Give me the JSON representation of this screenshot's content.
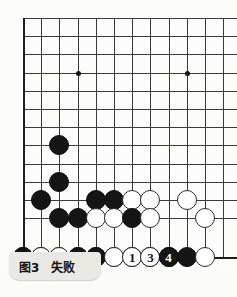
{
  "figure": {
    "caption_label": "图3",
    "caption_text": "失败",
    "caption_full": "图3　失败"
  },
  "board": {
    "type": "go-board-corner-diagram",
    "columns": 12,
    "rows": 13,
    "cell_size": 18.2,
    "origin_x": 23,
    "origin_y": 18,
    "line_color": "#3a3a3a",
    "edge_color": "#1d1d1d",
    "background": "#fcfcfa",
    "star_points": [
      {
        "col": 4,
        "row": 4
      },
      {
        "col": 10,
        "row": 4
      }
    ]
  },
  "stones": [
    {
      "col": 3,
      "row": 8,
      "color": "black",
      "label": ""
    },
    {
      "col": 3,
      "row": 10,
      "color": "black",
      "label": ""
    },
    {
      "col": 2,
      "row": 11,
      "color": "black",
      "label": ""
    },
    {
      "col": 5,
      "row": 11,
      "color": "black",
      "label": ""
    },
    {
      "col": 6,
      "row": 11,
      "color": "black",
      "label": ""
    },
    {
      "col": 7,
      "row": 11,
      "color": "white",
      "label": ""
    },
    {
      "col": 8,
      "row": 11,
      "color": "white",
      "label": ""
    },
    {
      "col": 10,
      "row": 11,
      "color": "white",
      "label": ""
    },
    {
      "col": 3,
      "row": 12,
      "color": "black",
      "label": ""
    },
    {
      "col": 4,
      "row": 12,
      "color": "black",
      "label": ""
    },
    {
      "col": 5,
      "row": 12,
      "color": "white",
      "label": ""
    },
    {
      "col": 6,
      "row": 12,
      "color": "white",
      "label": ""
    },
    {
      "col": 7,
      "row": 12,
      "color": "black",
      "label": ""
    },
    {
      "col": 8,
      "row": 12,
      "color": "white",
      "label": ""
    },
    {
      "col": 11,
      "row": 12,
      "color": "white",
      "label": ""
    },
    {
      "col": 1,
      "row": 13,
      "color": "black",
      "label": ""
    },
    {
      "col": 2,
      "row": 13,
      "color": "black",
      "label": ""
    },
    {
      "col": 3,
      "row": 13,
      "color": "white",
      "label": ""
    },
    {
      "col": 4,
      "row": 13,
      "color": "white",
      "label": ""
    },
    {
      "col": 5,
      "row": 13,
      "color": "white",
      "label": "5"
    },
    {
      "col": 6,
      "row": 13,
      "color": "white",
      "label": ""
    },
    {
      "col": 7,
      "row": 13,
      "color": "black",
      "label": ""
    },
    {
      "col": 8,
      "row": 13,
      "color": "black",
      "label": ""
    },
    {
      "col": 9,
      "row": 13,
      "color": "black",
      "label": ""
    },
    {
      "col": 10,
      "row": 13,
      "color": "black",
      "label": ""
    },
    {
      "col": 11,
      "row": 13,
      "color": "white",
      "label": ""
    },
    {
      "col": 1,
      "row": 14,
      "color": "black",
      "label": "8"
    },
    {
      "col": 2,
      "row": 14,
      "color": "white",
      "label": ""
    },
    {
      "col": 3,
      "row": 14,
      "color": "white",
      "label": "7"
    },
    {
      "col": 4,
      "row": 14,
      "color": "black",
      "label": "6"
    },
    {
      "col": 5,
      "row": 14,
      "color": "black",
      "label": "2"
    },
    {
      "col": 6,
      "row": 14,
      "color": "white",
      "label": ""
    },
    {
      "col": 7,
      "row": 14,
      "color": "white",
      "label": "1"
    },
    {
      "col": 8,
      "row": 14,
      "color": "white",
      "label": "3"
    },
    {
      "col": 9,
      "row": 14,
      "color": "black",
      "label": "4"
    }
  ],
  "move_sequence": [
    {
      "number": "1",
      "color": "white"
    },
    {
      "number": "2",
      "color": "black"
    },
    {
      "number": "3",
      "color": "white"
    },
    {
      "number": "4",
      "color": "black"
    },
    {
      "number": "5",
      "color": "white"
    },
    {
      "number": "6",
      "color": "black"
    },
    {
      "number": "7",
      "color": "white"
    },
    {
      "number": "8",
      "color": "black"
    }
  ]
}
